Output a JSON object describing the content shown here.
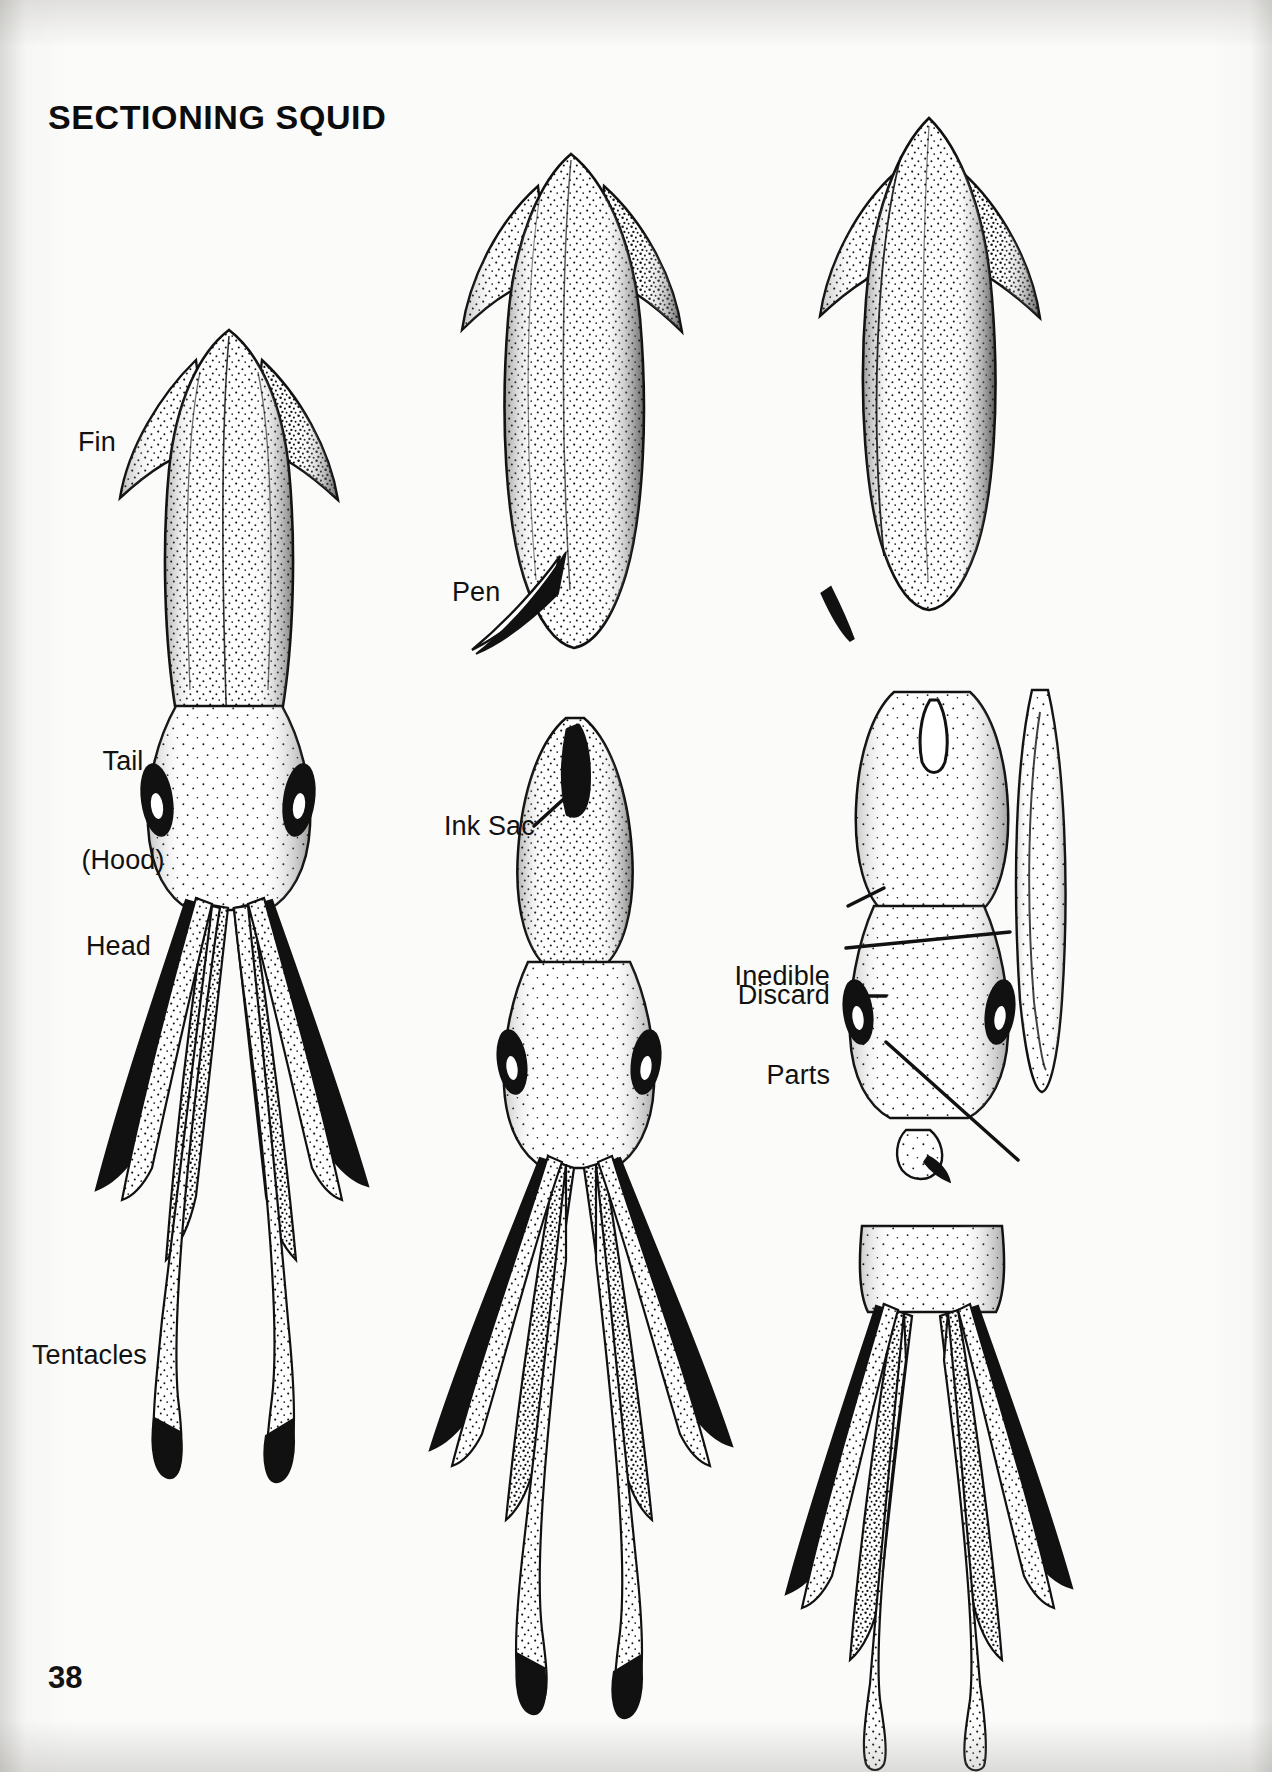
{
  "page": {
    "title": "SECTIONING SQUID",
    "page_number": "38",
    "background_color": "#fbfbfa",
    "ink_color": "#111111"
  },
  "figure": {
    "type": "stippled line-art anatomical illustration",
    "subject": "squid",
    "panels": [
      {
        "name": "whole-squid-ventral",
        "position": "left column",
        "description": "Whole squid seen from below showing fin, tail (hood), head, arms and two long tentacles"
      },
      {
        "name": "squid-with-pen-removed",
        "position": "top middle",
        "description": "Squid body with the pen (quill) being pulled out of the mantle"
      },
      {
        "name": "squid-head-ink-sac",
        "position": "bottom middle",
        "description": "Squid with mantle skinned showing ink sac in the head"
      },
      {
        "name": "mantle-cleaned",
        "position": "top right",
        "description": "Cleaned mantle tube with the removed pen lying beside it"
      },
      {
        "name": "inedible-parts-discard",
        "position": "middle right",
        "description": "Head section with cut line marking the inedible parts and the beak to discard, with side view of mantle"
      },
      {
        "name": "tentacles-section",
        "position": "bottom right",
        "description": "Severed head and tentacle section"
      }
    ]
  },
  "labels": [
    {
      "id": "fin",
      "text": "Fin",
      "lines": [
        "Fin"
      ]
    },
    {
      "id": "tail-hood",
      "text": "Tail (Hood)",
      "lines": [
        "Tail",
        "(Hood)"
      ]
    },
    {
      "id": "head",
      "text": "Head",
      "lines": [
        "Head"
      ]
    },
    {
      "id": "tentacles",
      "text": "Tentacles",
      "lines": [
        "Tentacles"
      ]
    },
    {
      "id": "pen",
      "text": "Pen",
      "lines": [
        "Pen"
      ]
    },
    {
      "id": "ink-sac",
      "text": "Ink Sac",
      "lines": [
        "Ink Sac"
      ]
    },
    {
      "id": "inedible-parts",
      "text": "Inedible Parts",
      "lines": [
        "Inedible",
        "Parts"
      ]
    },
    {
      "id": "discard",
      "text": "Discard",
      "lines": [
        "Discard"
      ]
    }
  ],
  "label_text": {
    "fin": "Fin",
    "tail_line1": "Tail",
    "tail_line2": "(Hood)",
    "head": "Head",
    "tentacles": "Tentacles",
    "pen": "Pen",
    "ink_sac": "Ink Sac",
    "inedible_line1": "Inedible",
    "inedible_line2": "Parts",
    "discard": "Discard"
  }
}
